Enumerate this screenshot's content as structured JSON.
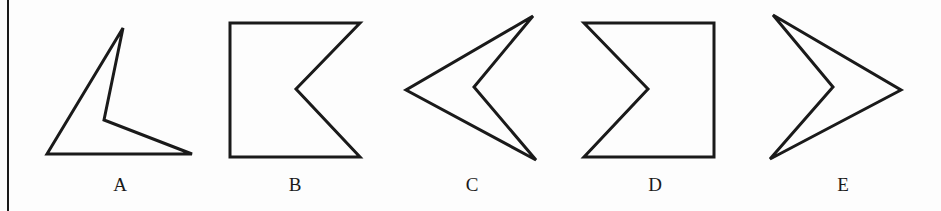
{
  "figure": {
    "stroke_color": "#1a1a1a",
    "background": "#fdfdfd",
    "shapes": [
      {
        "label": "A",
        "points": "123,28 47,154 192,154 104,120",
        "label_x": 120
      },
      {
        "label": "B",
        "points": "230,23 360,23 296,89 360,157 230,157",
        "label_x": 295
      },
      {
        "label": "C",
        "points": "533,16 406,90 536,160 474,87",
        "label_x": 472
      },
      {
        "label": "D",
        "points": "584,23 714,23 714,157 584,157 648,89",
        "label_x": 655
      },
      {
        "label": "E",
        "points": "773,15 901,90 770,159 833,87",
        "label_x": 843
      }
    ]
  }
}
